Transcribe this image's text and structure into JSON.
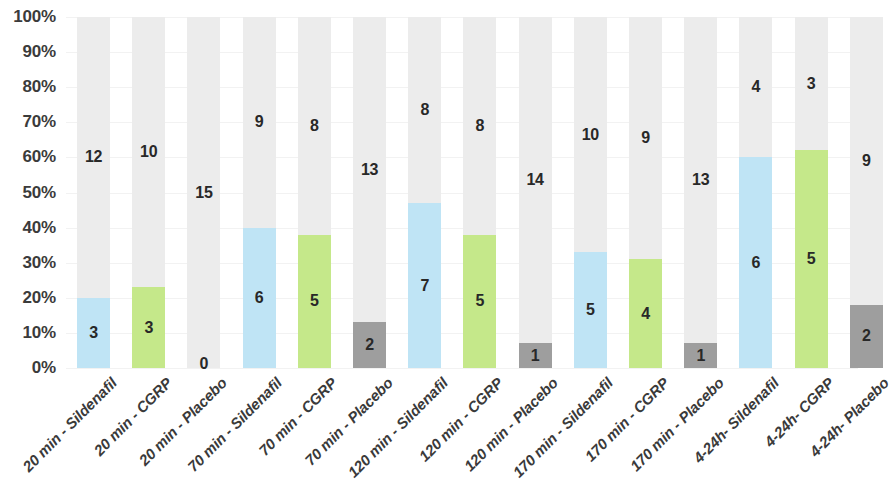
{
  "chart_data": {
    "type": "bar",
    "subtype": "100% stacked bar",
    "title": "",
    "xlabel": "",
    "ylabel": "",
    "ylim": [
      0,
      100
    ],
    "ytick_labels": [
      "0%",
      "10%",
      "20%",
      "30%",
      "40%",
      "50%",
      "60%",
      "70%",
      "80%",
      "90%",
      "100%"
    ],
    "ytick_values": [
      0,
      10,
      20,
      30,
      40,
      50,
      60,
      70,
      80,
      90,
      100
    ],
    "grid": true,
    "legend": "none",
    "categories": [
      "20 min - Sildenafil",
      "20 min - CGRP",
      "20 min - Placebo",
      "70 min - Sildenafil",
      "70 min - CGRP",
      "70 min - Placebo",
      "120 min - Sildenafil",
      "120 min - CGRP",
      "120 min - Placebo",
      "170 min - Sildenafil",
      "170 min - CGRP",
      "170 min - Placebo",
      "4-24h- Sildenafil",
      "4-24h- CGRP",
      "4-24h- Placebo"
    ],
    "series": [
      {
        "name": "Responders",
        "values": [
          3,
          3,
          0,
          6,
          5,
          2,
          7,
          5,
          1,
          5,
          4,
          1,
          6,
          5,
          2
        ],
        "percents": [
          20,
          23,
          0,
          40,
          38,
          13,
          47,
          38,
          7,
          33,
          31,
          7,
          60,
          62,
          18
        ]
      },
      {
        "name": "Non-responders",
        "values": [
          12,
          10,
          15,
          9,
          8,
          13,
          8,
          8,
          14,
          10,
          9,
          13,
          4,
          3,
          9
        ],
        "percents": [
          80,
          77,
          100,
          60,
          62,
          87,
          53,
          62,
          93,
          67,
          69,
          93,
          40,
          38,
          82
        ]
      }
    ],
    "bars": [
      {
        "label": "20 min - Sildenafil",
        "arm": "Sildenafil",
        "bottom_value": "3",
        "top_value": "12",
        "bottom_pct": 20,
        "color_key": "sildenafil"
      },
      {
        "label": "20 min - CGRP",
        "arm": "CGRP",
        "bottom_value": "3",
        "top_value": "10",
        "bottom_pct": 23,
        "color_key": "cgrp"
      },
      {
        "label": "20 min - Placebo",
        "arm": "Placebo",
        "bottom_value": "0",
        "top_value": "15",
        "bottom_pct": 0,
        "color_key": "placebo"
      },
      {
        "label": "70 min - Sildenafil",
        "arm": "Sildenafil",
        "bottom_value": "6",
        "top_value": "9",
        "bottom_pct": 40,
        "color_key": "sildenafil"
      },
      {
        "label": "70 min - CGRP",
        "arm": "CGRP",
        "bottom_value": "5",
        "top_value": "8",
        "bottom_pct": 38,
        "color_key": "cgrp"
      },
      {
        "label": "70 min - Placebo",
        "arm": "Placebo",
        "bottom_value": "2",
        "top_value": "13",
        "bottom_pct": 13,
        "color_key": "placebo"
      },
      {
        "label": "120 min - Sildenafil",
        "arm": "Sildenafil",
        "bottom_value": "7",
        "top_value": "8",
        "bottom_pct": 47,
        "color_key": "sildenafil"
      },
      {
        "label": "120 min - CGRP",
        "arm": "CGRP",
        "bottom_value": "5",
        "top_value": "8",
        "bottom_pct": 38,
        "color_key": "cgrp"
      },
      {
        "label": "120 min - Placebo",
        "arm": "Placebo",
        "bottom_value": "1",
        "top_value": "14",
        "bottom_pct": 7,
        "color_key": "placebo"
      },
      {
        "label": "170 min - Sildenafil",
        "arm": "Sildenafil",
        "bottom_value": "5",
        "top_value": "10",
        "bottom_pct": 33,
        "color_key": "sildenafil"
      },
      {
        "label": "170 min - CGRP",
        "arm": "CGRP",
        "bottom_value": "4",
        "top_value": "9",
        "bottom_pct": 31,
        "color_key": "cgrp"
      },
      {
        "label": "170 min - Placebo",
        "arm": "Placebo",
        "bottom_value": "1",
        "top_value": "13",
        "bottom_pct": 7,
        "color_key": "placebo"
      },
      {
        "label": "4-24h- Sildenafil",
        "arm": "Sildenafil",
        "bottom_value": "6",
        "top_value": "4",
        "bottom_pct": 60,
        "color_key": "sildenafil"
      },
      {
        "label": "4-24h- CGRP",
        "arm": "CGRP",
        "bottom_value": "5",
        "top_value": "3",
        "bottom_pct": 62,
        "color_key": "cgrp"
      },
      {
        "label": "4-24h- Placebo",
        "arm": "Placebo",
        "bottom_value": "2",
        "top_value": "9",
        "bottom_pct": 18,
        "color_key": "placebo"
      }
    ],
    "colors": {
      "sildenafil": "#bfe4f5",
      "cgrp": "#c5e88a",
      "placebo": "#9e9e9e",
      "remainder": "#ececec",
      "gridline": "#f2f2f2",
      "axis_text": "#3b3b3b",
      "data_label": "#282828",
      "background": "#ffffff"
    },
    "layout": {
      "baseline_y": 368,
      "top_y": 17,
      "first_bar_x": 77,
      "bar_width": 33,
      "bar_pitch": 55.2
    }
  }
}
